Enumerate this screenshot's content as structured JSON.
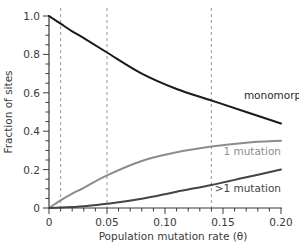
{
  "chart_data": {
    "type": "line",
    "title": "",
    "xlabel": "Population mutation rate (θ)",
    "ylabel": "Fraction of sites",
    "xlim": [
      0,
      0.2
    ],
    "ylim": [
      0,
      1.0
    ],
    "grid": false,
    "legend": "inline labels at right end of each line",
    "x_ticks": [
      0,
      0.05,
      0.1,
      0.15,
      0.2
    ],
    "x_tick_labels": [
      "0",
      "0.05",
      "0.10",
      "0.15",
      "0.20"
    ],
    "y_ticks": [
      0,
      0.2,
      0.4,
      0.6,
      0.8,
      1.0
    ],
    "y_tick_labels": [
      "0",
      "0.2",
      "0.4",
      "0.6",
      "0.8",
      "1.0"
    ],
    "reference_lines": [
      {
        "orientation": "vertical",
        "x": 0.01,
        "style": "dashed",
        "color": "#9a9a9a"
      },
      {
        "orientation": "vertical",
        "x": 0.05,
        "style": "dashed",
        "color": "#9a9a9a"
      },
      {
        "orientation": "vertical",
        "x": 0.14,
        "style": "dashed",
        "color": "#9a9a9a"
      }
    ],
    "x": [
      0,
      0.01,
      0.02,
      0.03,
      0.05,
      0.08,
      0.11,
      0.14,
      0.17,
      0.2
    ],
    "series": [
      {
        "name": "monomorphic",
        "color": "#1a1a1a",
        "values": [
          1.0,
          0.96,
          0.92,
          0.885,
          0.81,
          0.7,
          0.62,
          0.56,
          0.5,
          0.44
        ]
      },
      {
        "name": "1 mutation",
        "color": "#8c8c8c",
        "values": [
          0.0,
          0.04,
          0.075,
          0.105,
          0.17,
          0.245,
          0.29,
          0.32,
          0.34,
          0.35
        ]
      },
      {
        "name": ">1 mutation",
        "color": "#444444",
        "values": [
          0.0,
          0.002,
          0.005,
          0.009,
          0.022,
          0.048,
          0.085,
          0.12,
          0.16,
          0.2
        ]
      }
    ]
  }
}
